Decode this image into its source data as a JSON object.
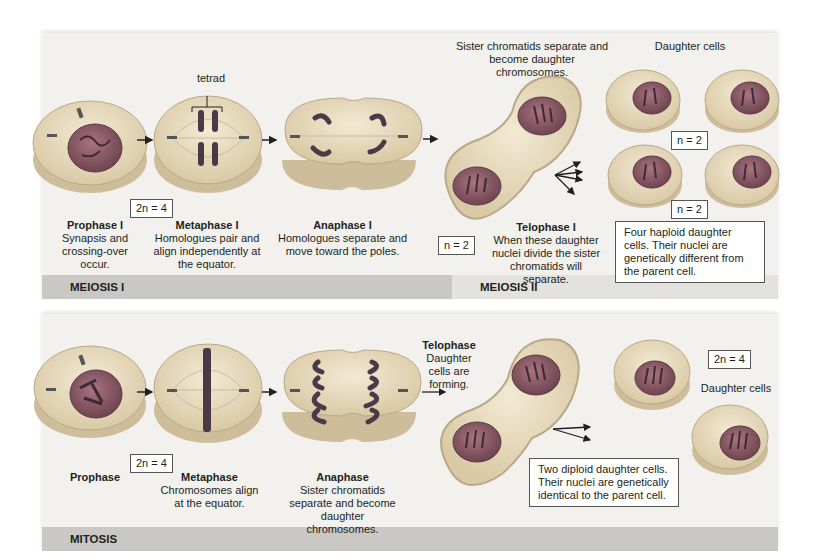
{
  "meiosis": {
    "bar_labels": [
      "MEIOSIS I",
      "MEIOSIS II"
    ],
    "tetrad_label": "tetrad",
    "ploidy_2n": "2n = 4",
    "phases": [
      {
        "title": "Prophase I",
        "desc": "Synapsis and crossing-over occur."
      },
      {
        "title": "Metaphase I",
        "desc": "Homologues pair and align independently at the equator."
      },
      {
        "title": "Anaphase I",
        "desc": "Homologues separate and move toward the poles."
      },
      {
        "title": "Telophase I",
        "desc": "When these daughter nuclei divide the sister chromatids will separate."
      }
    ],
    "telophase_ploidy": "n = 2",
    "sister_note": "Sister chromatids separate and become daughter chromosomes.",
    "daughter_cells_label": "Daughter cells",
    "daughter_ploidy_top": "n = 2",
    "daughter_ploidy_bottom": "n = 2",
    "summary": "Four haploid daughter cells. Their nuclei are genetically different from the parent cell."
  },
  "mitosis": {
    "bar_label": "MITOSIS",
    "ploidy_2n": "2n = 4",
    "phases": [
      {
        "title": "Prophase",
        "desc": ""
      },
      {
        "title": "Metaphase",
        "desc": "Chromosomes align at the equator."
      },
      {
        "title": "Anaphase",
        "desc": "Sister chromatids separate and become daughter chromosomes."
      },
      {
        "title": "Telophase",
        "desc": "Daughter cells are forming."
      }
    ],
    "daughter_ploidy": "2n = 4",
    "daughter_cells_label": "Daughter cells",
    "summary": "Two diploid daughter cells. Their nuclei are genetically identical to the parent cell."
  },
  "colors": {
    "cytoplasm": "#e8dcc0",
    "cell_edge": "#b9a98a",
    "nucleus": "#8c5a66",
    "chromosome": "#4a3a48",
    "panel_bg": "#f2f1ee",
    "bar_dark": "#c9c8c5",
    "bar_light": "#e3e2df"
  }
}
